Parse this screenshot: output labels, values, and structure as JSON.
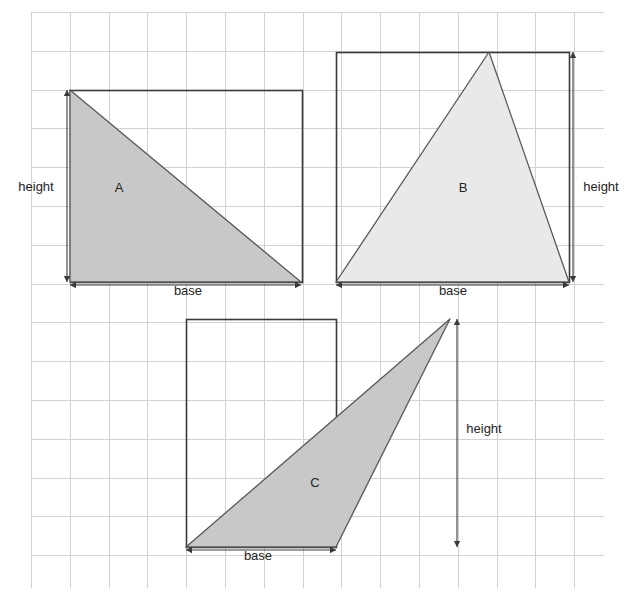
{
  "figure": {
    "background_color": "#ffffff",
    "grid": {
      "line_color": "#d2d2d6",
      "cell_size": 38.8,
      "x_start": 31,
      "y_start": 12,
      "x_end": 604,
      "y_end": 588,
      "columns": 15,
      "rows": 15,
      "visible": true
    },
    "colors": {
      "outline": "#3a3a3a",
      "triangle_stroke": "#585858",
      "fill_dark": "#c8c8c8",
      "fill_light": "#e9e9e9",
      "text": "#242424"
    }
  },
  "shapes": [
    {
      "id": "A",
      "letter_label": "A",
      "letter_pos": {
        "x": 119,
        "y": 192
      },
      "type": "right-triangle",
      "fill": "#c8c8c8",
      "bounding_rect": {
        "x": 70,
        "y": 90,
        "width": 232,
        "height": 192
      },
      "vertices": [
        {
          "x": 70,
          "y": 90
        },
        {
          "x": 70,
          "y": 282
        },
        {
          "x": 301,
          "y": 282
        }
      ],
      "dimensions": [
        {
          "name": "height",
          "label": "height",
          "orientation": "vertical",
          "label_pos": {
            "x": 36,
            "y": 191
          },
          "line": {
            "x1": 67,
            "y1": 90,
            "x2": 67,
            "y2": 282
          }
        },
        {
          "name": "base",
          "label": "base",
          "orientation": "horizontal",
          "label_pos": {
            "x": 188,
            "y": 295
          },
          "line": {
            "x1": 70,
            "y1": 285,
            "x2": 301,
            "y2": 285
          }
        }
      ]
    },
    {
      "id": "B",
      "letter_label": "B",
      "letter_pos": {
        "x": 463,
        "y": 192
      },
      "type": "acute-triangle",
      "fill": "#e9e9e9",
      "bounding_rect": {
        "x": 336,
        "y": 52,
        "width": 233,
        "height": 230
      },
      "vertices": [
        {
          "x": 336,
          "y": 282
        },
        {
          "x": 489,
          "y": 52
        },
        {
          "x": 569,
          "y": 282
        }
      ],
      "dimensions": [
        {
          "name": "height",
          "label": "height",
          "orientation": "vertical",
          "label_pos": {
            "x": 601,
            "y": 191
          },
          "line": {
            "x1": 573,
            "y1": 52,
            "x2": 573,
            "y2": 282
          }
        },
        {
          "name": "base",
          "label": "base",
          "orientation": "horizontal",
          "label_pos": {
            "x": 453,
            "y": 295
          },
          "line": {
            "x1": 336,
            "y1": 285,
            "x2": 569,
            "y2": 285
          }
        }
      ]
    },
    {
      "id": "C",
      "letter_label": "C",
      "letter_pos": {
        "x": 315,
        "y": 487
      },
      "type": "obtuse-triangle",
      "fill": "#c8c8c8",
      "bounding_rect": {
        "x": 186,
        "y": 319,
        "width": 150,
        "height": 228
      },
      "vertices": [
        {
          "x": 186,
          "y": 547
        },
        {
          "x": 336,
          "y": 547
        },
        {
          "x": 450,
          "y": 319
        }
      ],
      "dimensions": [
        {
          "name": "height",
          "label": "height",
          "orientation": "vertical",
          "label_pos": {
            "x": 484,
            "y": 433
          },
          "line": {
            "x1": 457,
            "y1": 319,
            "x2": 457,
            "y2": 547
          }
        },
        {
          "name": "base",
          "label": "base",
          "orientation": "horizontal",
          "label_pos": {
            "x": 258,
            "y": 560
          },
          "line": {
            "x1": 186,
            "y1": 550,
            "x2": 336,
            "y2": 550
          }
        }
      ]
    }
  ]
}
